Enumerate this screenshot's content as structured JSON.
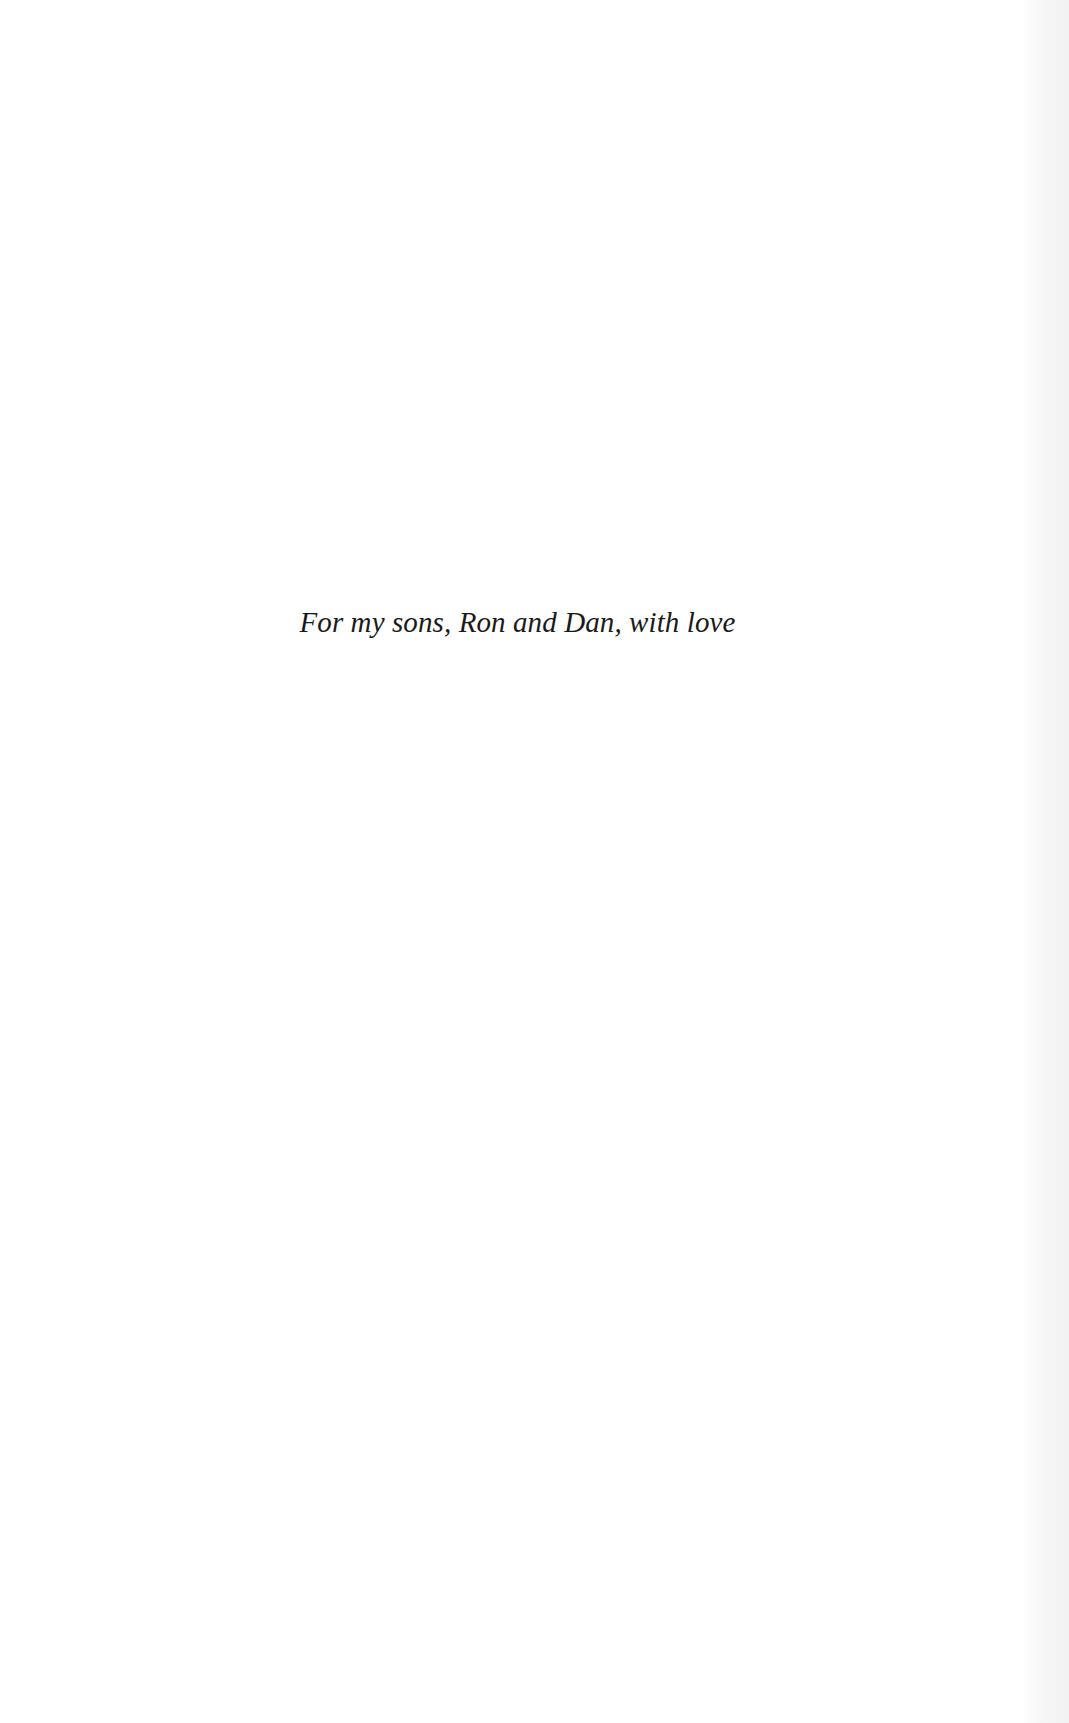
{
  "page": {
    "dedication": "For my sons, Ron and Dan, with love"
  }
}
